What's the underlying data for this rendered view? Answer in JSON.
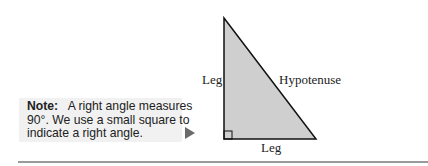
{
  "note": {
    "label": "Note:",
    "text_line1": "A right angle measures",
    "text_line2": "90°. We use a small square to",
    "text_line3": "indicate a right angle."
  },
  "figure": {
    "shape": "right-triangle",
    "fill_color": "#cfcfcf",
    "stroke_color": "#111111",
    "labels": {
      "left_leg": "Leg",
      "hypotenuse": "Hypotenuse",
      "bottom_leg": "Leg"
    }
  }
}
